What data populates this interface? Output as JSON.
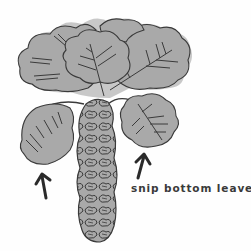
{
  "illustration": {
    "subject": "brussels sprouts stalk",
    "caption": "snip bottom leaves.",
    "colors": {
      "leaf_fill": "#a9a9a9",
      "outline": "#3a3a3a",
      "background": "#fefefe",
      "shadow": "#c8c8c8"
    },
    "arrows": [
      {
        "name": "left-arrow",
        "direction": "up"
      },
      {
        "name": "right-arrow",
        "direction": "up"
      }
    ]
  }
}
